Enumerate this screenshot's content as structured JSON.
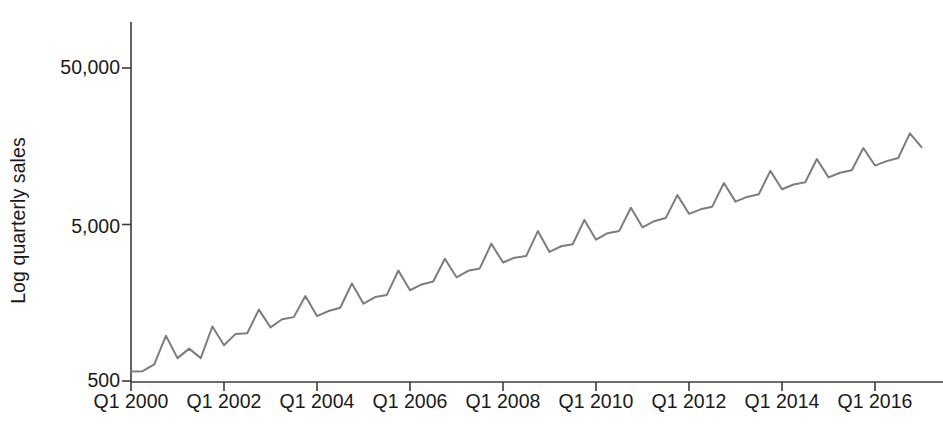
{
  "chart_data": {
    "type": "line",
    "title": "",
    "xlabel": "",
    "ylabel": "Log quarterly sales",
    "yscale": "log",
    "ylim": [
      500,
      100000
    ],
    "y_tick_labels": [
      "50,000",
      "5,000",
      "500"
    ],
    "y_tick_values": [
      50000,
      5000,
      500
    ],
    "x_tick_labels": [
      "Q1 2000",
      "Q1 2002",
      "Q1 2004",
      "Q1 2006",
      "Q1 2008",
      "Q1 2010",
      "Q1 2012",
      "Q1 2014",
      "Q1 2016"
    ],
    "grid": false,
    "legend": "none",
    "line_color": "#7d7d7d",
    "line_width": 2.0,
    "series": [
      {
        "name": "Quarterly sales",
        "x": [
          "Q1 2000",
          "Q2 2000",
          "Q3 2000",
          "Q4 2000",
          "Q1 2001",
          "Q2 2001",
          "Q3 2001",
          "Q4 2001",
          "Q1 2002",
          "Q2 2002",
          "Q3 2002",
          "Q4 2002",
          "Q1 2003",
          "Q2 2003",
          "Q3 2003",
          "Q4 2003",
          "Q1 2004",
          "Q2 2004",
          "Q3 2004",
          "Q4 2004",
          "Q1 2005",
          "Q2 2005",
          "Q3 2005",
          "Q4 2005",
          "Q1 2006",
          "Q2 2006",
          "Q3 2006",
          "Q4 2006",
          "Q1 2007",
          "Q2 2007",
          "Q3 2007",
          "Q4 2007",
          "Q1 2008",
          "Q2 2008",
          "Q3 2008",
          "Q4 2008",
          "Q1 2009",
          "Q2 2009",
          "Q3 2009",
          "Q4 2009",
          "Q1 2010",
          "Q2 2010",
          "Q3 2010",
          "Q4 2010",
          "Q1 2011",
          "Q2 2011",
          "Q3 2011",
          "Q4 2011",
          "Q1 2012",
          "Q2 2012",
          "Q3 2012",
          "Q4 2012",
          "Q1 2013",
          "Q2 2013",
          "Q3 2013",
          "Q4 2013",
          "Q1 2014",
          "Q2 2014",
          "Q3 2014",
          "Q4 2014",
          "Q1 2015",
          "Q2 2015",
          "Q3 2015",
          "Q4 2015",
          "Q1 2016",
          "Q2 2016",
          "Q3 2016",
          "Q4 2016",
          "Q1 2017"
        ],
        "values": [
          574,
          578,
          638,
          972,
          700,
          805,
          700,
          1115,
          847,
          1000,
          1010,
          1430,
          1100,
          1240,
          1280,
          1745,
          1300,
          1400,
          1470,
          2100,
          1560,
          1720,
          1770,
          2540,
          1900,
          2070,
          2160,
          3020,
          2300,
          2530,
          2620,
          3770,
          2860,
          3070,
          3150,
          4540,
          3340,
          3630,
          3740,
          5350,
          4000,
          4400,
          4550,
          6400,
          4800,
          5250,
          5500,
          7700,
          5850,
          6250,
          6500,
          9200,
          7000,
          7500,
          7800,
          11000,
          8400,
          9000,
          9300,
          13100,
          10000,
          10700,
          11100,
          15400,
          11900,
          12700,
          13300,
          19100,
          15600
        ]
      }
    ]
  },
  "axes": {
    "x_origin_px": 131,
    "x_px_per_two_years": 93,
    "y_500_px": 381,
    "y_5000_px": 227,
    "y_50000_px": 68,
    "axis_top_px": 22,
    "axis_color": "#3a3a3a"
  }
}
